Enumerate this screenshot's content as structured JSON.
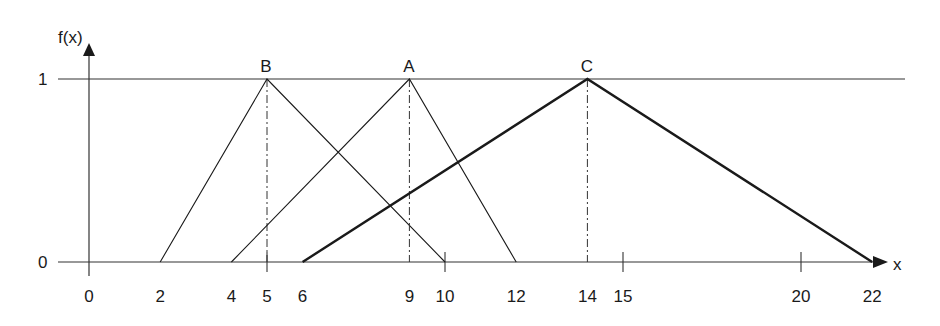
{
  "chart_data": {
    "type": "line",
    "title": "",
    "xlabel": "x",
    "ylabel": "f(x)",
    "xlim": [
      0,
      22
    ],
    "ylim": [
      0,
      1
    ],
    "grid": false,
    "x_tick_labels": [
      "0",
      "2",
      "4",
      "5",
      "6",
      "9",
      "10",
      "12",
      "14",
      "15",
      "20",
      "22"
    ],
    "x_ticks": [
      0,
      2,
      4,
      5,
      6,
      9,
      10,
      12,
      14,
      15,
      20,
      22
    ],
    "y_tick_labels": [
      "0",
      "1"
    ],
    "y_ticks": [
      0,
      1
    ],
    "reference_line_y": 1,
    "series": [
      {
        "name": "B",
        "shape": "triangle",
        "x": [
          2,
          5,
          10
        ],
        "y": [
          0,
          1,
          0
        ],
        "peak": 5,
        "style": "thin"
      },
      {
        "name": "A",
        "shape": "triangle",
        "x": [
          4,
          9,
          12
        ],
        "y": [
          0,
          1,
          0
        ],
        "peak": 9,
        "style": "thin"
      },
      {
        "name": "C",
        "shape": "triangle",
        "x": [
          6,
          14,
          22
        ],
        "y": [
          0,
          1,
          0
        ],
        "peak": 14,
        "style": "bold"
      }
    ],
    "peak_markers": "dash-dot vertical lines at x = 5, 9, 14",
    "tick_marks_on_axis": [
      5,
      10,
      15,
      20
    ]
  },
  "labels": {
    "y_axis": "f(x)",
    "x_axis": "x",
    "y0": "0",
    "y1": "1",
    "peak_B": "B",
    "peak_A": "A",
    "peak_C": "C"
  }
}
